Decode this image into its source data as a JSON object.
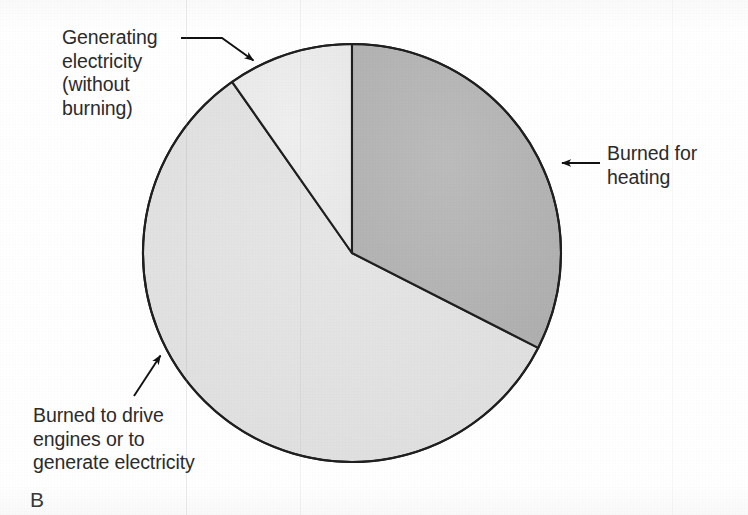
{
  "figure": {
    "letter": "B",
    "background_color": "#ffffff",
    "outline_color": "#1f1f1f"
  },
  "chart_data": {
    "type": "pie",
    "title": "",
    "subtitle": "",
    "xlabel": "",
    "ylabel": "",
    "grid": false,
    "legend_position": "callout-labels",
    "center": {
      "x": 352,
      "y": 253
    },
    "radius": 209,
    "start_angle_deg": 0,
    "direction": "clockwise",
    "categories": [
      "Burned for heating",
      "Burned to drive engines or to generate electricity",
      "Generating electricity (without burning)"
    ],
    "values": [
      32.5,
      57.8,
      9.7
    ],
    "value_unit": "percent",
    "angles_deg": [
      117,
      208,
      35
    ],
    "colors": [
      "#b4b4b4",
      "#e2e2e2",
      "#ececec"
    ],
    "slices": [
      {
        "label": "Burned for heating",
        "value": 32.5,
        "start_angle_deg": 0,
        "end_angle_deg": 117,
        "color": "#b4b4b4"
      },
      {
        "label": "Burned to drive engines or to generate electricity",
        "value": 57.8,
        "start_angle_deg": 117,
        "end_angle_deg": 325,
        "color": "#e2e2e2"
      },
      {
        "label": "Generating electricity (without burning)",
        "value": 9.7,
        "start_angle_deg": 325,
        "end_angle_deg": 360,
        "color": "#ececec"
      }
    ]
  },
  "labels": {
    "generating": {
      "lines": [
        "Generating",
        "electricity",
        "(without",
        "burning)"
      ],
      "text": "Generating\nelectricity\n(without\nburning)"
    },
    "heating": {
      "lines": [
        "Burned for",
        "heating"
      ],
      "text": "Burned for\nheating"
    },
    "engines": {
      "lines": [
        "Burned to drive",
        "engines or to",
        "generate electricity"
      ],
      "text": "Burned to drive\nengines or to\ngenerate electricity"
    }
  }
}
